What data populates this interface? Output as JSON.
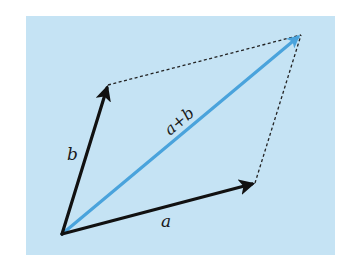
{
  "diagram": {
    "colors": {
      "page_background": "#ffffff",
      "panel_background": "#c5e3f4",
      "vector_color": "#111111",
      "sum_color": "#4aa3dc",
      "dashed_color": "#222222"
    },
    "labels": {
      "vector_a": "a",
      "vector_b": "b",
      "sum": "a+b"
    },
    "points": {
      "origin": [
        62,
        234
      ],
      "a_tip": [
        255,
        183
      ],
      "b_tip": [
        108,
        85
      ],
      "sum_tip": [
        301,
        35
      ]
    },
    "elements": [
      {
        "id": "vector-a",
        "type": "arrow",
        "from": "origin",
        "to": "a_tip",
        "label": "a",
        "style": "solid-black"
      },
      {
        "id": "vector-b",
        "type": "arrow",
        "from": "origin",
        "to": "b_tip",
        "label": "b",
        "style": "solid-black"
      },
      {
        "id": "vector-sum",
        "type": "arrow",
        "from": "origin",
        "to": "sum_tip",
        "label": "a+b",
        "style": "solid-blue"
      },
      {
        "id": "dashed-b-to-sum",
        "type": "line",
        "from": "b_tip",
        "to": "sum_tip",
        "style": "dashed"
      },
      {
        "id": "dashed-a-to-sum",
        "type": "line",
        "from": "a_tip",
        "to": "sum_tip",
        "style": "dashed"
      }
    ]
  }
}
